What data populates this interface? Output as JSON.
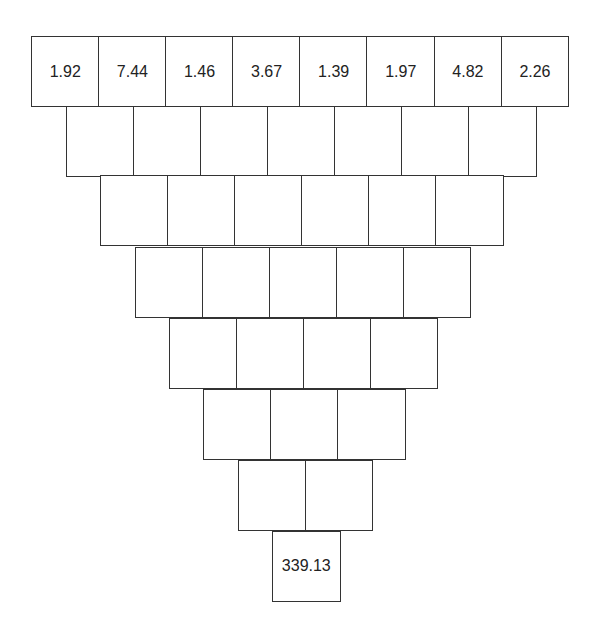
{
  "puzzle": {
    "type": "inverted-number-pyramid",
    "title_fragment": "",
    "line_color": "#333333",
    "rows": [
      {
        "cells": [
          "1.92",
          "7.44",
          "1.46",
          "3.67",
          "1.39",
          "1.97",
          "4.82",
          "2.26"
        ]
      },
      {
        "cells": [
          "",
          "",
          "",
          "",
          "",
          "",
          ""
        ]
      },
      {
        "cells": [
          "",
          "",
          "",
          "",
          "",
          ""
        ]
      },
      {
        "cells": [
          "",
          "",
          "",
          "",
          ""
        ]
      },
      {
        "cells": [
          "",
          "",
          "",
          ""
        ]
      },
      {
        "cells": [
          "",
          "",
          ""
        ]
      },
      {
        "cells": [
          "",
          ""
        ]
      },
      {
        "cells": [
          "339.13"
        ]
      }
    ]
  }
}
